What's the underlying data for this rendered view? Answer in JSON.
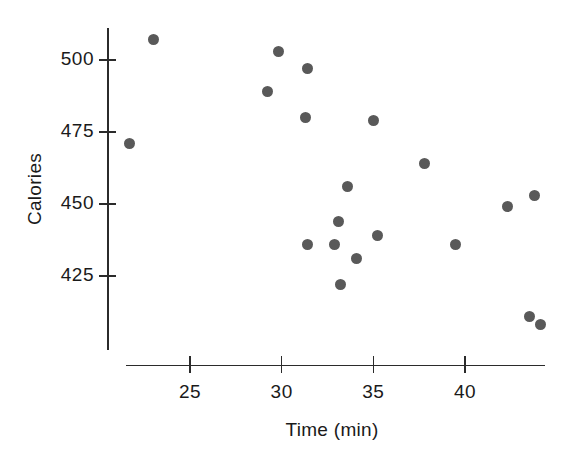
{
  "chart_data": {
    "type": "scatter",
    "title": "",
    "xlabel": "Time (min)",
    "ylabel": "Calories",
    "xlim": [
      20.5,
      45.5
    ],
    "ylim": [
      400,
      515
    ],
    "grid": false,
    "legend": null,
    "point_color": "#595959",
    "axis_color": "#2b2b2b",
    "xticks": [
      25,
      30,
      35,
      40
    ],
    "xtick_labels": [
      "25",
      "30",
      "35",
      "40"
    ],
    "yticks": [
      425,
      450,
      475,
      500
    ],
    "ytick_labels": [
      "425",
      "450",
      "475",
      "500"
    ],
    "points": [
      {
        "x": 21.7,
        "y": 471
      },
      {
        "x": 23.0,
        "y": 507
      },
      {
        "x": 29.2,
        "y": 489
      },
      {
        "x": 29.8,
        "y": 503
      },
      {
        "x": 31.3,
        "y": 480
      },
      {
        "x": 31.4,
        "y": 497
      },
      {
        "x": 31.4,
        "y": 436
      },
      {
        "x": 32.9,
        "y": 436
      },
      {
        "x": 33.1,
        "y": 444
      },
      {
        "x": 33.2,
        "y": 422
      },
      {
        "x": 33.6,
        "y": 456
      },
      {
        "x": 34.1,
        "y": 431
      },
      {
        "x": 35.2,
        "y": 439
      },
      {
        "x": 35.0,
        "y": 479
      },
      {
        "x": 37.8,
        "y": 464
      },
      {
        "x": 39.5,
        "y": 436
      },
      {
        "x": 42.3,
        "y": 449
      },
      {
        "x": 43.5,
        "y": 411
      },
      {
        "x": 43.8,
        "y": 453
      },
      {
        "x": 44.1,
        "y": 408
      }
    ]
  }
}
